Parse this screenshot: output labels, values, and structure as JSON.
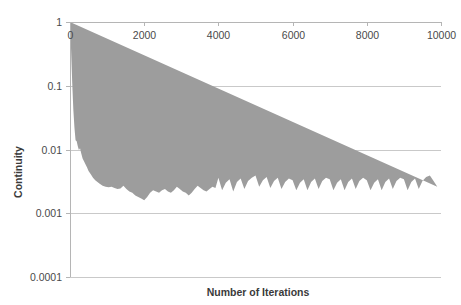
{
  "chart_data": {
    "type": "line",
    "title": "",
    "xlabel": "Number of Iterations",
    "ylabel": "Continuity",
    "yscale": "log",
    "xlim": [
      0,
      10000
    ],
    "ylim": [
      0.0001,
      1
    ],
    "grid": true,
    "legend": "none",
    "x_tick_labels": [
      "0",
      "2000",
      "4000",
      "6000",
      "8000",
      "10000"
    ],
    "x_ticks": [
      0,
      2000,
      4000,
      6000,
      8000,
      10000
    ],
    "x_axis_position": "top",
    "y_tick_labels": [
      "1",
      "0.1",
      "0.01",
      "0.001",
      "0.0001"
    ],
    "y_ticks": [
      1,
      0.1,
      0.01,
      0.001,
      0.0001
    ],
    "series": [
      {
        "name": "Continuity residual",
        "color": "#9d9d9d",
        "description": "Noisy oscillating residual history: steep initial drop from 1 to about 0.01 within the first 200 iterations, a noisy plateau near 0.0015 with a dip to 0.0008 around iteration 2000, then regular large-amplitude oscillations between about 0.0011 and 0.0035 after iteration 4000.",
        "x": [
          0,
          30,
          60,
          90,
          120,
          150,
          180,
          210,
          240,
          270,
          300,
          340,
          380,
          420,
          460,
          500,
          560,
          620,
          680,
          740,
          800,
          880,
          960,
          1040,
          1120,
          1200,
          1280,
          1360,
          1440,
          1520,
          1600,
          1680,
          1760,
          1840,
          1920,
          2000,
          2080,
          2160,
          2240,
          2320,
          2400,
          2480,
          2560,
          2640,
          2720,
          2800,
          2880,
          2960,
          3040,
          3120,
          3200,
          3280,
          3360,
          3440,
          3520,
          3600,
          3680,
          3760,
          3840,
          3920,
          4000,
          4100,
          4200,
          4300,
          4400,
          4500,
          4600,
          4700,
          4800,
          4900,
          5000,
          5100,
          5200,
          5300,
          5400,
          5500,
          5600,
          5700,
          5800,
          5900,
          6000,
          6100,
          6200,
          6300,
          6400,
          6500,
          6600,
          6700,
          6800,
          6900,
          7000,
          7100,
          7200,
          7300,
          7400,
          7500,
          7600,
          7700,
          7800,
          7900,
          8000,
          8100,
          8200,
          8300,
          8400,
          8500,
          8600,
          8700,
          8800,
          8900,
          9000,
          9100,
          9200,
          9300,
          9400,
          9500,
          9600,
          9700,
          9800,
          9900,
          10000
        ],
        "y_upper": [
          1.0,
          0.35,
          0.11,
          0.042,
          0.022,
          0.014,
          0.0135,
          0.0112,
          0.0098,
          0.0105,
          0.0088,
          0.0072,
          0.0065,
          0.0058,
          0.0052,
          0.0046,
          0.0041,
          0.0036,
          0.0033,
          0.0031,
          0.0029,
          0.0027,
          0.0026,
          0.00255,
          0.0026,
          0.0025,
          0.0024,
          0.00245,
          0.0027,
          0.0024,
          0.0022,
          0.0021,
          0.0019,
          0.0018,
          0.0017,
          0.0016,
          0.0018,
          0.0021,
          0.0023,
          0.0022,
          0.0021,
          0.0023,
          0.0024,
          0.0022,
          0.0021,
          0.0023,
          0.0026,
          0.0024,
          0.0022,
          0.0021,
          0.0019,
          0.0021,
          0.0024,
          0.0027,
          0.0025,
          0.0023,
          0.0022,
          0.0024,
          0.0026,
          0.0025,
          0.0036,
          0.0023,
          0.003,
          0.0034,
          0.0022,
          0.0031,
          0.0035,
          0.0024,
          0.0032,
          0.0036,
          0.0039,
          0.0026,
          0.0033,
          0.0037,
          0.0025,
          0.0032,
          0.0036,
          0.0024,
          0.0031,
          0.0035,
          0.0033,
          0.0023,
          0.003,
          0.0034,
          0.0023,
          0.0031,
          0.0035,
          0.0024,
          0.0032,
          0.0036,
          0.0034,
          0.0023,
          0.003,
          0.0034,
          0.0023,
          0.0031,
          0.0035,
          0.0024,
          0.0032,
          0.0036,
          0.0033,
          0.0023,
          0.003,
          0.0034,
          0.0023,
          0.0031,
          0.0035,
          0.0024,
          0.0032,
          0.0036,
          0.0034,
          0.0023,
          0.0031,
          0.0035,
          0.0024,
          0.0032,
          0.0037,
          0.0039,
          0.0032,
          0.0026
        ],
        "y_lower": [
          0.9,
          0.25,
          0.075,
          0.03,
          0.0155,
          0.0098,
          0.0092,
          0.008,
          0.007,
          0.0074,
          0.0062,
          0.0051,
          0.0046,
          0.0041,
          0.0037,
          0.0033,
          0.0029,
          0.0026,
          0.0024,
          0.0022,
          0.0021,
          0.002,
          0.0019,
          0.00185,
          0.00185,
          0.0018,
          0.0017,
          0.00175,
          0.0019,
          0.0017,
          0.0016,
          0.00145,
          0.0013,
          0.00125,
          0.00115,
          0.0008,
          0.0011,
          0.0013,
          0.0015,
          0.0014,
          0.00135,
          0.00145,
          0.0015,
          0.00135,
          0.0013,
          0.0014,
          0.0016,
          0.0015,
          0.0014,
          0.00135,
          0.00115,
          0.0013,
          0.0015,
          0.0017,
          0.0016,
          0.0014,
          0.00135,
          0.0015,
          0.0016,
          0.00155,
          0.0022,
          0.00115,
          0.0018,
          0.0021,
          0.00115,
          0.0019,
          0.0022,
          0.00125,
          0.002,
          0.0023,
          0.0025,
          0.0013,
          0.0021,
          0.0023,
          0.00125,
          0.002,
          0.0022,
          0.0012,
          0.0019,
          0.0022,
          0.0021,
          0.00115,
          0.0019,
          0.0021,
          0.00115,
          0.0019,
          0.0022,
          0.0012,
          0.002,
          0.0023,
          0.0021,
          0.00115,
          0.0019,
          0.0021,
          0.00115,
          0.0019,
          0.0022,
          0.0012,
          0.002,
          0.0023,
          0.0021,
          0.00115,
          0.0019,
          0.0021,
          0.00115,
          0.0019,
          0.0022,
          0.0012,
          0.002,
          0.0023,
          0.0021,
          0.00115,
          0.0019,
          0.0022,
          0.0012,
          0.002,
          0.0024,
          0.0026,
          0.002,
          0.0015
        ]
      }
    ]
  },
  "colors": {
    "series": "#9d9d9d",
    "gridline": "#c9c9c9",
    "axis": "#b5b5b5",
    "text": "#4a4a4a",
    "background": "#ffffff"
  }
}
